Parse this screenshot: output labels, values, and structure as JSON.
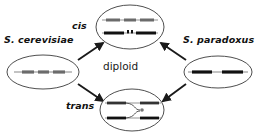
{
  "diagram": {
    "title_text": "",
    "labels": {
      "left_species": "S. cerevisiae",
      "right_species": "S. paradoxus",
      "top_mode": "cis",
      "bottom_mode": "trans",
      "center": "diploid"
    },
    "nodes": [
      {
        "id": "left-parent",
        "label": "S. cerevisiae",
        "shape": "ellipse",
        "cx": 43,
        "cy": 72,
        "rx": 36,
        "ry": 17,
        "chromosomes": [
          {
            "y": 72,
            "x1": 16,
            "x2": 70,
            "segments": [
              [
                22,
                34
              ],
              [
                38,
                49
              ],
              [
                53,
                65
              ]
            ],
            "color": "#6b6b6b"
          }
        ]
      },
      {
        "id": "right-parent",
        "label": "S. paradoxus",
        "shape": "ellipse",
        "cx": 218,
        "cy": 72,
        "rx": 34,
        "ry": 16,
        "chromosomes": [
          {
            "y": 72,
            "x1": 188,
            "x2": 248,
            "segments": [
              [
                192,
                212
              ],
              [
                222,
                243
              ]
            ],
            "color": "#111111"
          }
        ]
      },
      {
        "id": "cis-diploid",
        "label": "cis",
        "shape": "ellipse",
        "cx": 130,
        "cy": 27,
        "rx": 34,
        "ry": 22,
        "chromosomes": [
          {
            "y": 20,
            "x1": 103,
            "x2": 157,
            "segments": [
              [
                106,
                120
              ],
              [
                123,
                136
              ],
              [
                139,
                154
              ]
            ],
            "color": "#6b6b6b"
          },
          {
            "y": 33,
            "x1": 103,
            "x2": 157,
            "segments": [
              [
                104,
                124
              ],
              [
                136,
                156
              ]
            ],
            "color": "#111111",
            "marker": true
          }
        ]
      },
      {
        "id": "trans-diploid",
        "label": "trans",
        "shape": "ellipse",
        "cx": 132,
        "cy": 110,
        "rx": 32,
        "ry": 21,
        "chromosomes": [
          {
            "y": 103,
            "x1": 106,
            "x2": 160,
            "segments": [
              [
                107,
                126
              ],
              [
                140,
                159
              ]
            ],
            "color": "#333333"
          },
          {
            "y": 118,
            "x1": 106,
            "x2": 160,
            "segments": [
              [
                107,
                126
              ],
              [
                140,
                159
              ]
            ],
            "color": "#111111"
          }
        ],
        "trans_link": true
      }
    ],
    "edges": [
      {
        "id": "left-to-cis",
        "from": "left-parent",
        "to": "cis-diploid",
        "x1": 78,
        "y1": 60,
        "x2": 104,
        "y2": 43,
        "arrow": true
      },
      {
        "id": "left-to-trans",
        "from": "left-parent",
        "to": "trans-diploid",
        "x1": 78,
        "y1": 84,
        "x2": 104,
        "y2": 101,
        "arrow": true
      },
      {
        "id": "right-to-cis",
        "from": "right-parent",
        "to": "cis-diploid",
        "x1": 186,
        "y1": 60,
        "x2": 160,
        "y2": 43,
        "arrow": true
      },
      {
        "id": "right-to-trans",
        "from": "right-parent",
        "to": "trans-diploid",
        "x1": 186,
        "y1": 84,
        "x2": 162,
        "y2": 101,
        "arrow": true
      }
    ],
    "colors": {
      "outline": "#3a3a3a",
      "text": "#111111",
      "arrow": "#1a1a1a",
      "chromosome_gray": "#6b6b6b",
      "chromosome_dark": "#111111",
      "background": "#ffffff"
    }
  }
}
